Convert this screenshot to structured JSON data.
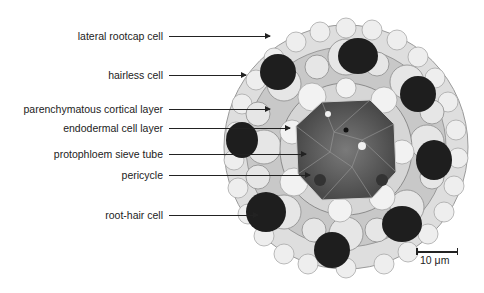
{
  "figure": {
    "labels": [
      {
        "text": "lateral rootcap cell",
        "y": 36,
        "tip": 270
      },
      {
        "text": "hairless cell",
        "y": 75,
        "tip": 246
      },
      {
        "text": "parenchymatous cortical layer",
        "y": 109,
        "tip": 270
      },
      {
        "text": "endodermal cell layer",
        "y": 128,
        "tip": 290
      },
      {
        "text": "protophloem sieve tube",
        "y": 154,
        "tip": 306
      },
      {
        "text": "pericycle",
        "y": 175,
        "tip": 310
      },
      {
        "text": "root-hair cell",
        "y": 215,
        "tip": 258
      }
    ],
    "scale_bar": {
      "label": "10 μm"
    }
  }
}
